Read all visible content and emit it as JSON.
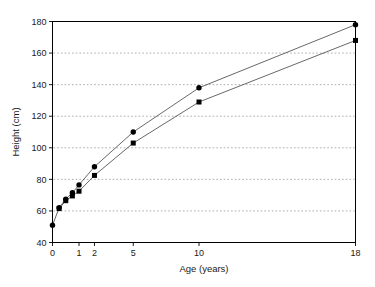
{
  "chart_data": {
    "type": "line",
    "title": "",
    "xlabel": "Age (years)",
    "ylabel": "Height (cm)",
    "xlim": [
      0,
      18
    ],
    "ylim": [
      40,
      180
    ],
    "grid": "horizontal-dotted",
    "legend": "none",
    "x_tick_labels": [
      "0",
      "1",
      "2",
      "5",
      "10",
      "18"
    ],
    "x_tick_values": [
      0,
      1,
      2,
      5,
      10,
      18
    ],
    "y_tick_labels": [
      "40",
      "60",
      "80",
      "100",
      "120",
      "140",
      "160",
      "180"
    ],
    "y_tick_values": [
      40,
      60,
      80,
      100,
      120,
      140,
      160,
      180
    ],
    "series": [
      {
        "name": "upper-series",
        "marker": "filled-circle",
        "x": [
          0,
          0.25,
          0.5,
          0.75,
          1,
          2,
          5,
          10,
          18
        ],
        "values": [
          51,
          62,
          67.5,
          71.5,
          76.5,
          88,
          110,
          138,
          178
        ]
      },
      {
        "name": "lower-series",
        "marker": "filled-square",
        "x": [
          0.25,
          0.5,
          0.75,
          1,
          2,
          5,
          10,
          18
        ],
        "values": [
          61.5,
          66.5,
          69.5,
          72.5,
          82.5,
          103,
          129,
          168
        ]
      }
    ]
  },
  "colors": {
    "marker": "#000000",
    "line": "#4d4d4d",
    "grid": "#8a8a8a",
    "frame": "#000000",
    "text": "#1a1a1a",
    "background": "#ffffff"
  }
}
